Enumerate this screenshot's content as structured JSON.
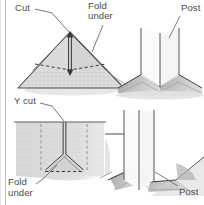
{
  "figure": {
    "panels": [
      {
        "id": "top-left",
        "name": "straight-cut-flat-view",
        "description": "Flat triangular piece of fabric with a straight slit cut to the apex and dashed fold-under lines"
      },
      {
        "id": "top-right",
        "name": "straight-cut-installed-view",
        "description": "Perspective view of the post with fabric folded under on both sides"
      },
      {
        "id": "bottom-left",
        "name": "y-cut-flat-view",
        "description": "Flat fabric sheet with a Y shaped cut and dashed fold-under triangle"
      },
      {
        "id": "bottom-right",
        "name": "y-cut-installed-view",
        "description": "Perspective view of the post set through the Y cut with folded flaps"
      }
    ],
    "labels": {
      "cut": "Cut",
      "fold_under_line1": "Fold",
      "fold_under_line2": "under",
      "post_top": "Post",
      "y_cut": "Y cut",
      "fold_under2_line1": "Fold",
      "fold_under2_line2": "under",
      "post_bottom": "Post"
    },
    "colors": {
      "background": "#ffffff",
      "fabric_fill": "#d8d8d8",
      "fabric_fill_light": "#e2e2e2",
      "shadow_dark": "#9a9a9a",
      "shadow_mid": "#b5b5b5",
      "stroke": "#4d4d4d",
      "text": "#4a4a4a",
      "frame": "#b9b9b9",
      "post_face": "#fbfbfb"
    }
  }
}
